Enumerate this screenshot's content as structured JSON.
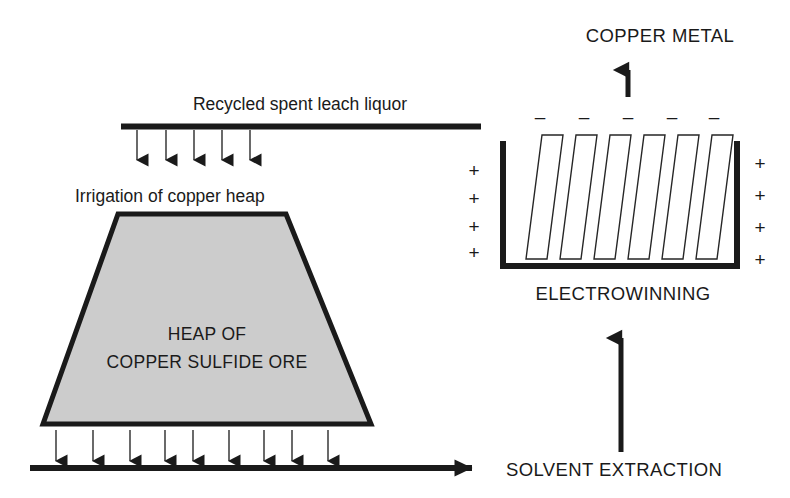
{
  "diagram": {
    "title_text": "Copper heap leaching and electrowinning flow diagram",
    "colors": {
      "ink": "#1a1a1a",
      "heap_fill": "#cccccc",
      "plate_fill": "#ffffff",
      "background": "#ffffff"
    },
    "labels": {
      "recycled_liquor": "Recycled spent leach liquor",
      "irrigation": "Irrigation of copper heap",
      "heap_line1": "HEAP OF",
      "heap_line2": "COPPER SULFIDE ORE",
      "copper_metal": "COPPER METAL",
      "electrowinning": "ELECTROWINNING",
      "solvent_extraction": "SOLVENT  EXTRACTION"
    },
    "electrowinning_cell": {
      "cathode_sign": "–",
      "anode_sign": "+",
      "cathode_sign_count": 5,
      "anode_sign_count_left": 4,
      "anode_sign_count_right": 5,
      "plate_count": 6
    },
    "flows": {
      "irrigation_arrow_count": 5,
      "drainage_arrow_count": 9,
      "to_solvent_extraction_arrow": "right",
      "to_electrowinning_arrow": "up",
      "copper_metal_arrow": "up"
    }
  }
}
